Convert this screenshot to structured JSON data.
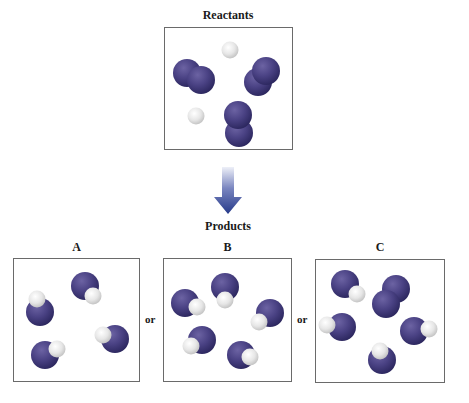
{
  "figure": {
    "reactants_label": "Reactants",
    "products_label": "Products",
    "connector_word": "or",
    "arrow_direction": "down-arrow-icon",
    "colors": {
      "nitrogen": "#3f3878",
      "hydrogen": "#e8e8e8",
      "arrow_top": "#e6e9f4",
      "arrow_bottom": "#263a8a",
      "box_border": "#6a6a6a"
    },
    "reactants": {
      "molecules": [
        {
          "formula": "N2",
          "atoms": [
            {
              "el": "N",
              "x": 187,
              "y": 73
            },
            {
              "el": "N",
              "x": 201,
              "y": 80
            }
          ]
        },
        {
          "formula": "N2",
          "atoms": [
            {
              "el": "N",
              "x": 258,
              "y": 82
            },
            {
              "el": "N",
              "x": 266,
              "y": 71
            }
          ]
        },
        {
          "formula": "N2",
          "atoms": [
            {
              "el": "N",
              "x": 239,
              "y": 133
            },
            {
              "el": "N",
              "x": 238,
              "y": 115
            }
          ]
        },
        {
          "formula": "H2",
          "atoms": [
            {
              "el": "H",
              "x": 230,
              "y": 50
            }
          ]
        },
        {
          "formula": "H2",
          "atoms": [
            {
              "el": "H",
              "x": 196,
              "y": 116
            }
          ]
        }
      ]
    },
    "products": [
      {
        "label": "A",
        "molecules": [
          {
            "formula": "NH",
            "atoms": [
              {
                "el": "N",
                "x": 40,
                "y": 312
              },
              {
                "el": "H",
                "x": 37,
                "y": 299
              }
            ]
          },
          {
            "formula": "NH",
            "atoms": [
              {
                "el": "N",
                "x": 85,
                "y": 286
              },
              {
                "el": "H",
                "x": 93,
                "y": 296
              }
            ]
          },
          {
            "formula": "NH",
            "atoms": [
              {
                "el": "N",
                "x": 115,
                "y": 339
              },
              {
                "el": "H",
                "x": 103,
                "y": 335
              }
            ]
          },
          {
            "formula": "NH",
            "atoms": [
              {
                "el": "N",
                "x": 45,
                "y": 355
              },
              {
                "el": "H",
                "x": 57,
                "y": 349
              }
            ]
          }
        ]
      },
      {
        "label": "B",
        "molecules": [
          {
            "formula": "NH",
            "atoms": [
              {
                "el": "N",
                "x": 185,
                "y": 303
              },
              {
                "el": "H",
                "x": 197,
                "y": 307
              }
            ]
          },
          {
            "formula": "NH",
            "atoms": [
              {
                "el": "N",
                "x": 225,
                "y": 287
              },
              {
                "el": "H",
                "x": 225,
                "y": 300
              }
            ]
          },
          {
            "formula": "NH",
            "atoms": [
              {
                "el": "N",
                "x": 270,
                "y": 313
              },
              {
                "el": "H",
                "x": 259,
                "y": 322
              }
            ]
          },
          {
            "formula": "NH",
            "atoms": [
              {
                "el": "N",
                "x": 202,
                "y": 340
              },
              {
                "el": "H",
                "x": 191,
                "y": 346
              }
            ]
          },
          {
            "formula": "NH",
            "atoms": [
              {
                "el": "N",
                "x": 241,
                "y": 355
              },
              {
                "el": "H",
                "x": 250,
                "y": 357
              }
            ]
          }
        ]
      },
      {
        "label": "C",
        "molecules": [
          {
            "formula": "NH",
            "atoms": [
              {
                "el": "N",
                "x": 345,
                "y": 284
              },
              {
                "el": "H",
                "x": 357,
                "y": 294
              }
            ]
          },
          {
            "formula": "N2",
            "atoms": [
              {
                "el": "N",
                "x": 396,
                "y": 289
              },
              {
                "el": "N",
                "x": 386,
                "y": 304
              }
            ]
          },
          {
            "formula": "NH",
            "atoms": [
              {
                "el": "N",
                "x": 342,
                "y": 327
              },
              {
                "el": "H",
                "x": 327,
                "y": 325
              }
            ]
          },
          {
            "formula": "NH",
            "atoms": [
              {
                "el": "N",
                "x": 414,
                "y": 331
              },
              {
                "el": "H",
                "x": 429,
                "y": 329
              }
            ]
          },
          {
            "formula": "NH",
            "atoms": [
              {
                "el": "N",
                "x": 382,
                "y": 360
              },
              {
                "el": "H",
                "x": 380,
                "y": 351
              }
            ]
          }
        ]
      }
    ]
  }
}
